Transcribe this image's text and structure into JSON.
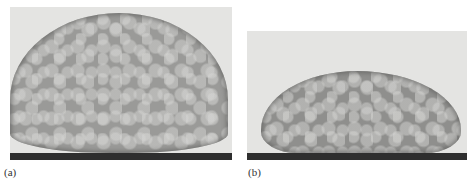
{
  "figure": {
    "panels": [
      {
        "id": "a",
        "label": "(a)",
        "description": "Foam-like droplet resting on a dark substrate, tall near-spherical cap shape with visible bubble/cellular texture",
        "colors": {
          "background": "#e4e4e2",
          "droplet": "#9a9a98",
          "substrate": "#2e2e2e"
        }
      },
      {
        "id": "b",
        "label": "(b)",
        "description": "Foam-like droplet on a dark substrate, flattened elongated shape with cellular texture",
        "colors": {
          "background": "#e4e4e2",
          "droplet": "#8f8f8d",
          "substrate": "#2e2e2e"
        }
      }
    ]
  }
}
